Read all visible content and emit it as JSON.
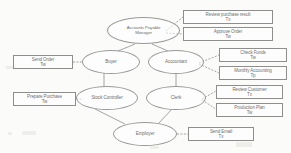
{
  "diagram": {
    "type": "use-case-diagram",
    "stroke_color": "#8e8e8c",
    "text_color": "#6f6f6e",
    "background_color": "#fbfbfa",
    "actors": [
      {
        "id": "accounts-payable-manager",
        "line1": "Accounts Payable",
        "line2": "Manager"
      },
      {
        "id": "buyer",
        "line1": "Buyer",
        "line2": ""
      },
      {
        "id": "accountant",
        "line1": "Accountant",
        "line2": ""
      },
      {
        "id": "stock-controller",
        "line1": "Stock Controller",
        "line2": ""
      },
      {
        "id": "clerk",
        "line1": "Clerk",
        "line2": ""
      },
      {
        "id": "employer",
        "line1": "Employer",
        "line2": ""
      }
    ],
    "use_cases": [
      {
        "id": "review-purchase-result",
        "label": "Review purchase result",
        "tag": "Tx"
      },
      {
        "id": "approve-order",
        "label": "Approve Order",
        "tag": "Tw"
      },
      {
        "id": "check-funds",
        "label": "Check Funds",
        "tag": "Tw"
      },
      {
        "id": "monthly-accounting",
        "label": "Monthly Accounting",
        "tag": "Tp"
      },
      {
        "id": "review-customer",
        "label": "Review Customer",
        "tag": "Tx"
      },
      {
        "id": "production-plan",
        "label": "Production Plan",
        "tag": "Tw"
      },
      {
        "id": "send-order",
        "label": "Send Order",
        "tag": "Tw"
      },
      {
        "id": "prepare-purchase",
        "label": "Prepare Purchase",
        "tag": "Tw"
      },
      {
        "id": "send-email",
        "label": "Send Email",
        "tag": "Tx"
      }
    ]
  }
}
